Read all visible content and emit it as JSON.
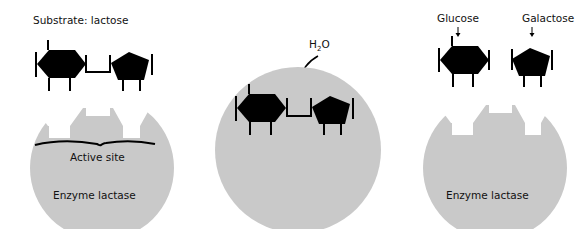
{
  "colors": {
    "enzyme": "#c9c9c9",
    "molecule": "#000000",
    "background": "#ffffff",
    "text": "#111111"
  },
  "panel1": {
    "substrate_label": "Substrate: lactose",
    "active_site_label": "Active site",
    "enzyme_label": "Enzyme lactase"
  },
  "panel2": {
    "water_label_h": "H",
    "water_label_sub": "2",
    "water_label_o": "O"
  },
  "panel3": {
    "glucose_label": "Glucose",
    "galactose_label": "Galactose",
    "enzyme_label": "Enzyme lactase"
  }
}
